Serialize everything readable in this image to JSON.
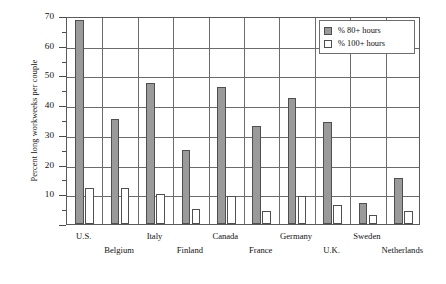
{
  "chart_data": {
    "type": "bar",
    "title": "",
    "xlabel": "",
    "ylabel": "Percent long workweeks per couple",
    "ylim": [
      0,
      70
    ],
    "ytick_step": 10,
    "yminor_step": 5,
    "grid": true,
    "legend_position": "top-right",
    "categories": [
      "U.S.",
      "Belgium",
      "Italy",
      "Finland",
      "Canada",
      "France",
      "Germany",
      "U.K.",
      "Sweden",
      "Netherlands"
    ],
    "yticks": [
      "0",
      "10",
      "20",
      "30",
      "40",
      "50",
      "60",
      "70"
    ],
    "series": [
      {
        "name": "% 80+ hours",
        "style": "filled",
        "color": "#9a9a9a",
        "values": [
          68.5,
          35.2,
          47.5,
          25.0,
          46.0,
          33.0,
          42.5,
          34.5,
          7.0,
          15.5
        ]
      },
      {
        "name": "% 100+ hours",
        "style": "open",
        "color": "#ffffff",
        "values": [
          12.0,
          12.0,
          10.0,
          5.0,
          9.5,
          4.5,
          9.5,
          6.5,
          3.0,
          4.5
        ]
      }
    ]
  },
  "legend": {
    "entries": [
      {
        "label": "% 80+ hours",
        "style": "filled"
      },
      {
        "label": "% 100+ hours",
        "style": "open"
      }
    ]
  }
}
